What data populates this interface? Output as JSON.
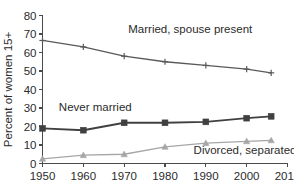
{
  "chart_data": {
    "type": "line",
    "title": "",
    "xlabel": "",
    "ylabel": "Percent of women 15+",
    "xlim": [
      1950,
      2010
    ],
    "ylim": [
      0,
      80
    ],
    "xticks": [
      1950,
      1960,
      1970,
      1980,
      1990,
      2000,
      2010
    ],
    "yticks": [
      0,
      10,
      20,
      30,
      40,
      50,
      60,
      70,
      80
    ],
    "grid": false,
    "legend_position": "inline-annotations",
    "x": [
      1950,
      1960,
      1970,
      1980,
      1990,
      2000,
      2006
    ],
    "series": [
      {
        "name": "Married, spouse present",
        "values": [
          66.5,
          63.0,
          58.0,
          55.0,
          53.0,
          51.0,
          49.0
        ],
        "color": "#595959",
        "marker": "plus",
        "label_x": 1971,
        "label_y": 70.5
      },
      {
        "name": "Never married",
        "values": [
          19.0,
          18.0,
          22.0,
          22.0,
          22.5,
          24.5,
          25.5
        ],
        "color": "#404040",
        "marker": "square",
        "label_x": 1954,
        "label_y": 28.5
      },
      {
        "name": "Divorced, separated",
        "values": [
          2.5,
          4.5,
          5.0,
          9.0,
          11.0,
          12.0,
          12.5
        ],
        "color": "#a6a6a6",
        "marker": "triangle",
        "label_x": 1987,
        "label_y": 5.0
      }
    ]
  },
  "axis": {
    "y_title": "Percent of women 15+",
    "y_tick_labels": [
      "0",
      "10",
      "20",
      "30",
      "40",
      "50",
      "60",
      "70",
      "80"
    ],
    "x_tick_labels": [
      "1950",
      "1960",
      "1970",
      "1980",
      "1990",
      "2000",
      "2010"
    ]
  },
  "annotations": {
    "married": "Married, spouse present",
    "never_married": "Never married",
    "divorced": "Divorced, separated"
  },
  "colors": {
    "married": "#595959",
    "never_married": "#404040",
    "divorced": "#a6a6a6",
    "axis": "#4a4a4a",
    "text": "#2b2b2b",
    "background": "#ffffff"
  }
}
